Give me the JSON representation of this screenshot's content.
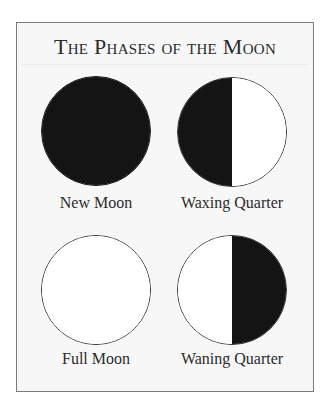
{
  "title": "The Phases of the Moon",
  "colors": {
    "dark": "#141414",
    "light": "#ffffff",
    "frame_border": "#7a7a7a",
    "frame_bg": "#f7f7f7",
    "text": "#2b2b2b"
  },
  "phases": [
    {
      "label": "New Moon",
      "left": "dark",
      "right": "dark"
    },
    {
      "label": "Waxing Quarter",
      "left": "dark",
      "right": "light"
    },
    {
      "label": "Full Moon",
      "left": "light",
      "right": "light"
    },
    {
      "label": "Waning Quarter",
      "left": "light",
      "right": "dark"
    }
  ]
}
